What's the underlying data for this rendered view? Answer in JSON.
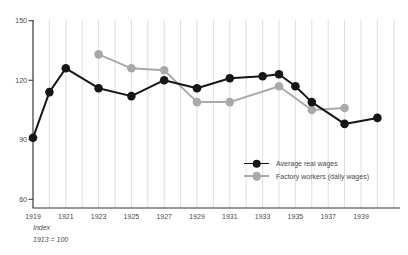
{
  "chart_data": {
    "type": "line",
    "title": "",
    "xlabel": "",
    "ylabel": "",
    "grid": "vertical-only",
    "legend_position": "center-right-inside",
    "x_axis": {
      "gridline_year_start": 1919,
      "gridline_year_end": 1941,
      "tick_labels": [
        "1919",
        "1921",
        "1923",
        "1925",
        "1927",
        "1929",
        "1931",
        "1933",
        "1935",
        "1937",
        "1939"
      ],
      "tick_years": [
        1919,
        1921,
        1923,
        1925,
        1927,
        1929,
        1931,
        1933,
        1935,
        1937,
        1939
      ]
    },
    "y_axis": {
      "ticks": [
        60,
        90,
        120,
        150
      ],
      "range": [
        60,
        150
      ]
    },
    "series": [
      {
        "name": "Average real wages",
        "color": "#161616",
        "points": [
          [
            1919,
            91
          ],
          [
            1920,
            114
          ],
          [
            1921,
            126
          ],
          [
            1923,
            116
          ],
          [
            1925,
            112
          ],
          [
            1927,
            120
          ],
          [
            1929,
            116
          ],
          [
            1931,
            121
          ],
          [
            1933,
            122
          ],
          [
            1934,
            123
          ],
          [
            1935,
            117
          ],
          [
            1936,
            109
          ],
          [
            1938,
            98
          ],
          [
            1940,
            101
          ]
        ]
      },
      {
        "name": "Factory workers (daily wages)",
        "color": "#a9a9a9",
        "points": [
          [
            1923,
            133
          ],
          [
            1925,
            126
          ],
          [
            1927,
            125
          ],
          [
            1929,
            109
          ],
          [
            1931,
            109
          ],
          [
            1934,
            117
          ],
          [
            1936,
            105
          ],
          [
            1938,
            106
          ]
        ]
      }
    ]
  },
  "footnote": {
    "line1": "Index",
    "line2": "1913 = 100"
  },
  "colors": {
    "background": "#ffffff",
    "gridline": "#dadada",
    "axis": "#333333",
    "text": "#4a4a4a"
  }
}
